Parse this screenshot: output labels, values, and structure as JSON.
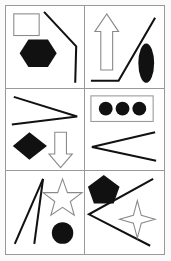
{
  "figure": {
    "layout": {
      "columns": 2,
      "rows": 3,
      "width": 171,
      "height": 261
    },
    "colors": {
      "background": "#ffffff",
      "page_margin": "#fbfbfb",
      "border": "#999999",
      "fill_black": "#111111",
      "outline_gray": "#8a8a8a",
      "line_black": "#111111"
    },
    "cells": [
      {
        "id": "cell-1",
        "position": "row-1-col-1",
        "shapes": [
          {
            "name": "square-outline",
            "kind": "square",
            "fill": "none",
            "stroke": "#8a8a8a",
            "location": "top-left"
          },
          {
            "name": "hexagon-filled",
            "kind": "hexagon",
            "fill": "#111111",
            "stroke": "none",
            "location": "center-left"
          },
          {
            "name": "bent-line",
            "kind": "polyline",
            "fill": "none",
            "stroke": "#111111",
            "location": "right"
          }
        ]
      },
      {
        "id": "cell-2",
        "position": "row-1-col-2",
        "shapes": [
          {
            "name": "up-arrow-outline",
            "kind": "arrow-up",
            "fill": "none",
            "stroke": "#8a8a8a",
            "location": "left-center"
          },
          {
            "name": "bent-line",
            "kind": "polyline",
            "fill": "none",
            "stroke": "#111111",
            "location": "bottom-diagonal"
          },
          {
            "name": "ellipse-filled",
            "kind": "ellipse",
            "fill": "#111111",
            "stroke": "none",
            "location": "right"
          }
        ]
      },
      {
        "id": "cell-3",
        "position": "row-2-col-1",
        "shapes": [
          {
            "name": "zigzag-right",
            "kind": "polyline",
            "fill": "none",
            "stroke": "#111111",
            "location": "top"
          },
          {
            "name": "diamond-filled",
            "kind": "diamond",
            "fill": "#111111",
            "stroke": "none",
            "location": "bottom-left"
          },
          {
            "name": "down-arrow-outline",
            "kind": "arrow-down",
            "fill": "none",
            "stroke": "#8a8a8a",
            "location": "bottom-right"
          }
        ]
      },
      {
        "id": "cell-4",
        "position": "row-2-col-2",
        "shapes": [
          {
            "name": "rectangle-outline",
            "kind": "rectangle",
            "fill": "none",
            "stroke": "#9a9a9a",
            "location": "top"
          },
          {
            "name": "circle-filled-1",
            "kind": "circle",
            "fill": "#111111",
            "stroke": "none",
            "location": "inside-rectangle-left"
          },
          {
            "name": "circle-filled-2",
            "kind": "circle",
            "fill": "#111111",
            "stroke": "none",
            "location": "inside-rectangle-center"
          },
          {
            "name": "circle-filled-3",
            "kind": "circle",
            "fill": "#111111",
            "stroke": "none",
            "location": "inside-rectangle-right"
          },
          {
            "name": "zigzag-left",
            "kind": "polyline",
            "fill": "none",
            "stroke": "#111111",
            "location": "bottom"
          }
        ]
      },
      {
        "id": "cell-5",
        "position": "row-3-col-1",
        "shapes": [
          {
            "name": "narrow-wedge-lines",
            "kind": "polyline",
            "fill": "none",
            "stroke": "#111111",
            "location": "left"
          },
          {
            "name": "star-5-outline",
            "kind": "star-5",
            "fill": "none",
            "stroke": "#8a8a8a",
            "location": "top-right"
          },
          {
            "name": "circle-filled",
            "kind": "circle",
            "fill": "#111111",
            "stroke": "none",
            "location": "bottom-right"
          }
        ]
      },
      {
        "id": "cell-6",
        "position": "row-3-col-2",
        "shapes": [
          {
            "name": "pentagon-filled",
            "kind": "pentagon",
            "fill": "#111111",
            "stroke": "none",
            "location": "top-left"
          },
          {
            "name": "zigzag-left",
            "kind": "polyline",
            "fill": "none",
            "stroke": "#111111",
            "location": "center"
          },
          {
            "name": "star-4-outline",
            "kind": "star-4",
            "fill": "none",
            "stroke": "#8a8a8a",
            "location": "bottom-right"
          }
        ]
      }
    ]
  }
}
